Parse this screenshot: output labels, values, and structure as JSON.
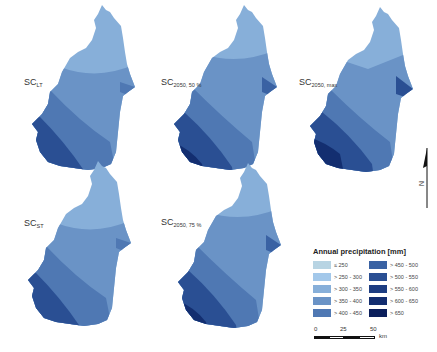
{
  "figure": {
    "maps": [
      {
        "id": "lt",
        "label_main": "SC",
        "label_sub": "LT"
      },
      {
        "id": "2050_50",
        "label_main": "SC",
        "label_sub": "2050, 50 %"
      },
      {
        "id": "2050_max",
        "label_main": "SC",
        "label_sub": "2050, max"
      },
      {
        "id": "st",
        "label_main": "SC",
        "label_sub": "ST"
      },
      {
        "id": "2050_75",
        "label_main": "SC",
        "label_sub": "2050, 75 %"
      }
    ],
    "legend": {
      "title": "Annual precipitation [mm]",
      "classes": [
        {
          "label": "≤ 250",
          "color": "#b8d4e3"
        },
        {
          "label": "> 250 - 300",
          "color": "#a3c8ea"
        },
        {
          "label": "> 300 - 350",
          "color": "#87afd9"
        },
        {
          "label": "> 350 - 400",
          "color": "#6a93c6"
        },
        {
          "label": "> 400 - 450",
          "color": "#4f78b3"
        },
        {
          "label": "> 450 - 500",
          "color": "#3a62a3"
        },
        {
          "label": "> 500 - 550",
          "color": "#2a4f93"
        },
        {
          "label": "> 550 - 600",
          "color": "#1d3d82"
        },
        {
          "label": "> 600 - 650",
          "color": "#132e70"
        },
        {
          "label": "> 650",
          "color": "#0b1f5c"
        }
      ]
    },
    "scale_bar": {
      "ticks": [
        "0",
        "25",
        "50"
      ],
      "unit": "km"
    },
    "north_arrow": {
      "label": "N"
    }
  }
}
